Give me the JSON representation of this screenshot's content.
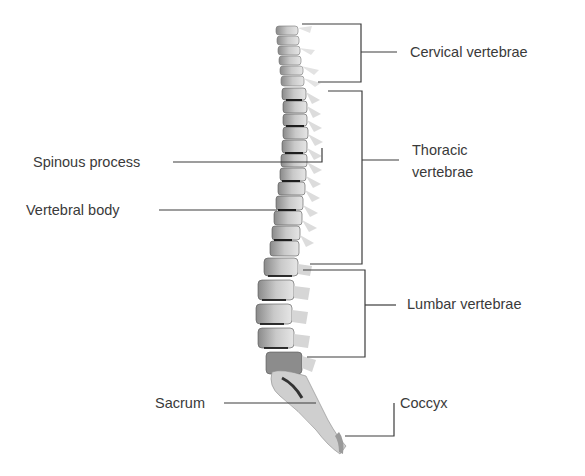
{
  "diagram": {
    "title": "",
    "labels": {
      "cervical": "Cervical vertebrae",
      "thoracic_line1": "Thoracic",
      "thoracic_line2": "vertebrae",
      "lumbar": "Lumbar vertebrae",
      "coccyx": "Coccyx",
      "spinous_process": "Spinous process",
      "vertebral_body": "Vertebral body",
      "sacrum": "Sacrum"
    },
    "colors": {
      "line": "#3c3c3c",
      "text": "#3a3a3a",
      "bone_light": "#d8d8d8",
      "bone_mid": "#9a9a9a",
      "bone_dark": "#2a2a2a"
    }
  }
}
